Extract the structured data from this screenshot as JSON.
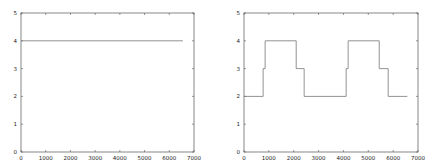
{
  "chart_data": [
    {
      "type": "line",
      "title": "",
      "xlabel": "",
      "ylabel": "",
      "xlim": [
        0,
        7000
      ],
      "ylim": [
        0,
        5
      ],
      "xticks": [
        0,
        1000,
        2000,
        3000,
        4000,
        5000,
        6000,
        7000
      ],
      "yticks": [
        0,
        1,
        2,
        3,
        4,
        5
      ],
      "grid": false,
      "legend": null,
      "series": [
        {
          "name": "series-1",
          "step": true,
          "x": [
            0,
            6550
          ],
          "y": [
            4,
            4
          ]
        }
      ]
    },
    {
      "type": "line",
      "title": "",
      "xlabel": "",
      "ylabel": "",
      "xlim": [
        0,
        7000
      ],
      "ylim": [
        0,
        5
      ],
      "xticks": [
        0,
        1000,
        2000,
        3000,
        4000,
        5000,
        6000,
        7000
      ],
      "yticks": [
        0,
        1,
        2,
        3,
        4,
        5
      ],
      "grid": false,
      "legend": null,
      "series": [
        {
          "name": "series-1",
          "step": true,
          "x": [
            0,
            770,
            850,
            2100,
            2420,
            4110,
            4190,
            5440,
            5800,
            6570
          ],
          "y": [
            2,
            3,
            4,
            3,
            2,
            3,
            4,
            3,
            2,
            2
          ]
        }
      ]
    }
  ],
  "plots": [
    {
      "box": {
        "left": 21,
        "top": 13,
        "right": 194,
        "bottom": 152
      }
    },
    {
      "box": {
        "left": 244,
        "top": 13,
        "right": 418,
        "bottom": 152
      }
    }
  ],
  "colors": {
    "axis": "#555555",
    "line": "#777777",
    "text": "#222222"
  }
}
